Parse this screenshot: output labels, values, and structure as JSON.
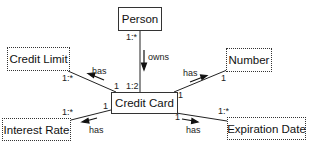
{
  "diagram": {
    "type": "entity-relationship",
    "nodes": {
      "person": {
        "label": "Person",
        "style": "solid"
      },
      "credit_card": {
        "label": "Credit Card",
        "style": "solid"
      },
      "credit_limit": {
        "label": "Credit Limit",
        "style": "dotted"
      },
      "number": {
        "label": "Number",
        "style": "dotted"
      },
      "interest_rate": {
        "label": "Interest Rate",
        "style": "dotted"
      },
      "expiration_date": {
        "label": "Expiration Date",
        "style": "dotted"
      }
    },
    "edges": {
      "owns": {
        "from": "Person",
        "to": "Credit Card",
        "label": "owns",
        "from_card": "1:*",
        "to_card": "1:2"
      },
      "has_credit_limit": {
        "from": "Credit Card",
        "to": "Credit Limit",
        "label": "has",
        "from_card": "1",
        "to_card": "1:*"
      },
      "has_number": {
        "from": "Credit Card",
        "to": "Number",
        "label": "has",
        "from_card": "1",
        "to_card": "1"
      },
      "has_interest_rate": {
        "from": "Credit Card",
        "to": "Interest Rate",
        "label": "has",
        "from_card": "1",
        "to_card": "1:*"
      },
      "has_expiration_date": {
        "from": "Credit Card",
        "to": "Expiration Date",
        "label": "has",
        "from_card": "1",
        "to_card": "1:*"
      }
    }
  }
}
